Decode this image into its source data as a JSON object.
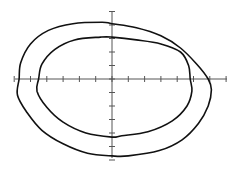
{
  "chart_data": {
    "type": "line",
    "title": "",
    "xlabel": "",
    "ylabel": "",
    "grid": false,
    "legend": null,
    "axes": {
      "origin_px": [
        112,
        79
      ],
      "x_range_px": [
        15,
        227
      ],
      "y_range_px": [
        12,
        158
      ],
      "x_tick_spacing_px": 16.3,
      "y_tick_spacing_px": 13.5,
      "x_ticks": [
        -6,
        -5,
        -4,
        -3,
        -2,
        -1,
        0,
        1,
        2,
        3,
        4,
        5,
        6,
        7
      ],
      "y_ticks": [
        5,
        4,
        3,
        2,
        1,
        0,
        -1,
        -2,
        -3,
        -4,
        -5,
        -6
      ]
    },
    "series": [
      {
        "name": "outer closed curve",
        "color": "#111111",
        "points": [
          [
            5.9,
            0
          ],
          [
            6.1,
            -0.8
          ],
          [
            5.9,
            -2.0
          ],
          [
            5.3,
            -3.3
          ],
          [
            4.3,
            -4.5
          ],
          [
            2.9,
            -5.3
          ],
          [
            1.0,
            -5.7
          ],
          [
            0,
            -5.7
          ],
          [
            -1.5,
            -5.5
          ],
          [
            -3.0,
            -4.8
          ],
          [
            -4.3,
            -3.8
          ],
          [
            -5.2,
            -2.5
          ],
          [
            -5.8,
            -1.2
          ],
          [
            -5.7,
            0
          ],
          [
            -5.6,
            1.2
          ],
          [
            -5.0,
            2.6
          ],
          [
            -3.9,
            3.6
          ],
          [
            -2.4,
            4.1
          ],
          [
            -0.6,
            4.2
          ],
          [
            0,
            4.1
          ],
          [
            1.5,
            3.8
          ],
          [
            3.0,
            3.2
          ],
          [
            4.2,
            2.3
          ],
          [
            5.2,
            1.1
          ],
          [
            5.9,
            0
          ]
        ]
      },
      {
        "name": "inner closed curve",
        "color": "#111111",
        "points": [
          [
            4.8,
            0
          ],
          [
            4.9,
            -0.9
          ],
          [
            4.6,
            -2.0
          ],
          [
            3.7,
            -3.1
          ],
          [
            2.2,
            -3.9
          ],
          [
            0.6,
            -4.2
          ],
          [
            0,
            -4.3
          ],
          [
            -1.6,
            -4.0
          ],
          [
            -3.0,
            -3.2
          ],
          [
            -4.0,
            -2.1
          ],
          [
            -4.6,
            -0.9
          ],
          [
            -4.5,
            0
          ],
          [
            -4.3,
            1.1
          ],
          [
            -3.5,
            2.2
          ],
          [
            -2.3,
            2.9
          ],
          [
            -0.7,
            3.1
          ],
          [
            0,
            3.1
          ],
          [
            1.5,
            2.9
          ],
          [
            3.0,
            2.6
          ],
          [
            4.2,
            2.0
          ],
          [
            4.7,
            1.0
          ],
          [
            4.8,
            0
          ]
        ]
      }
    ]
  }
}
